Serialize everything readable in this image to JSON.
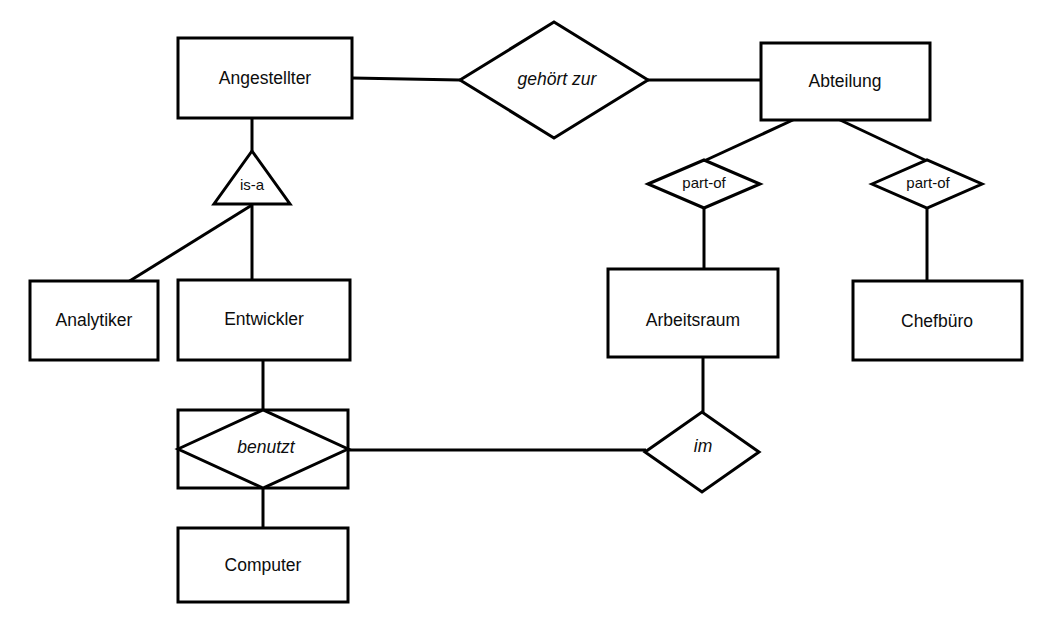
{
  "diagram": {
    "type": "entity-relationship-diagram",
    "language": "de",
    "colors": {
      "background": "#ffffff",
      "stroke": "#000000",
      "text": "#0d0d0d"
    },
    "entities": [
      {
        "id": "angestellter",
        "label": "Angestellter",
        "x": 178,
        "y": 38,
        "w": 174,
        "h": 80
      },
      {
        "id": "abteilung",
        "label": "Abteilung",
        "x": 761,
        "y": 43,
        "w": 169,
        "h": 77
      },
      {
        "id": "analytiker",
        "label": "Analytiker",
        "x": 30,
        "y": 281,
        "w": 128,
        "h": 79
      },
      {
        "id": "entwickler",
        "label": "Entwickler",
        "x": 178,
        "y": 280,
        "w": 172,
        "h": 80
      },
      {
        "id": "arbeitsraum",
        "label": "Arbeitsraum",
        "x": 608,
        "y": 269,
        "w": 170,
        "h": 88
      },
      {
        "id": "chefbuero",
        "label": "Chefbüro",
        "x": 853,
        "y": 281,
        "w": 169,
        "h": 79
      },
      {
        "id": "computer",
        "label": "Computer",
        "x": 178,
        "y": 528,
        "w": 170,
        "h": 74
      }
    ],
    "relationships": [
      {
        "id": "gehoert-zur",
        "label": "gehört zur",
        "style": "italic",
        "cx": 554,
        "cy": 80,
        "rx": 94,
        "ry": 58,
        "weak": false
      },
      {
        "id": "part-of-arbeitsraum",
        "label": "part-of",
        "style": "plain",
        "cx": 704,
        "cy": 184,
        "rx": 56,
        "ry": 24,
        "weak": false
      },
      {
        "id": "part-of-chefbuero",
        "label": "part-of",
        "style": "plain",
        "cx": 927,
        "cy": 184,
        "rx": 55,
        "ry": 24,
        "weak": false
      },
      {
        "id": "benutzt",
        "label": "benutzt",
        "style": "italic",
        "cx": 263,
        "cy": 449,
        "rx": 85,
        "ry": 39,
        "weak": true
      },
      {
        "id": "im",
        "label": "im",
        "style": "italic",
        "cx": 702,
        "cy": 452,
        "rx": 57,
        "ry": 40,
        "weak": false
      }
    ],
    "specializations": [
      {
        "id": "is-a",
        "label": "is-a",
        "apex_x": 252,
        "apex_y": 151,
        "base_left_x": 217,
        "base_right_x": 290,
        "base_y": 204
      }
    ],
    "connections": [
      {
        "id": "angestellter-gehoert-zur",
        "from": "angestellter",
        "to": "gehoert-zur",
        "points": "352,78 460,80"
      },
      {
        "id": "gehoert-zur-abteilung",
        "from": "gehoert-zur",
        "to": "abteilung",
        "points": "648,80 761,80"
      },
      {
        "id": "angestellter-isa",
        "from": "angestellter",
        "to": "is-a",
        "points": "252,118 252,151"
      },
      {
        "id": "isa-entwickler",
        "from": "is-a",
        "to": "entwickler",
        "points": "252,204 252,280"
      },
      {
        "id": "isa-analytiker",
        "from": "is-a",
        "to": "analytiker",
        "points": "252,204 128,281"
      },
      {
        "id": "entwickler-benutzt",
        "from": "entwickler",
        "to": "benutzt",
        "points": "263,360 263,410"
      },
      {
        "id": "benutzt-computer",
        "from": "benutzt",
        "to": "computer",
        "points": "263,488 263,528"
      },
      {
        "id": "benutzt-im",
        "from": "benutzt",
        "to": "im",
        "points": "348,450 645,450"
      },
      {
        "id": "abteilung-part-of-left",
        "from": "abteilung",
        "to": "part-of-arbeitsraum",
        "points": "795,120 704,160"
      },
      {
        "id": "abteilung-part-of-right",
        "from": "abteilung",
        "to": "part-of-chefbuero",
        "points": "838,120 927,160"
      },
      {
        "id": "part-of-arbeitsraum-arbeitsraum",
        "from": "part-of-arbeitsraum",
        "to": "arbeitsraum",
        "points": "704,208 704,269"
      },
      {
        "id": "part-of-chefbuero-chefbuero",
        "from": "part-of-chefbuero",
        "to": "chefbuero",
        "points": "927,208 927,281"
      },
      {
        "id": "arbeitsraum-im",
        "from": "arbeitsraum",
        "to": "im",
        "points": "703,357 703,412"
      }
    ]
  }
}
